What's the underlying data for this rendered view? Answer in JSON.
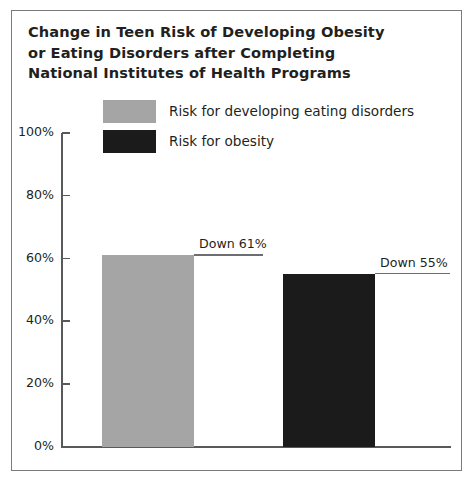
{
  "chart_data": {
    "type": "bar",
    "title": "Change in Teen Risk of Developing Obesity\nor Eating Disorders after Completing\nNational Institutes of Health Programs",
    "xlabel": "",
    "ylabel": "",
    "ylim": [
      0,
      100
    ],
    "ytick_labels": [
      "100%",
      "80%",
      "60%",
      "40%",
      "20%",
      "0%"
    ],
    "ytick_values": [
      100,
      80,
      60,
      40,
      20,
      0
    ],
    "grid": false,
    "legend_position": "top",
    "categories": [
      "Risk for developing eating disorders",
      "Risk for obesity"
    ],
    "values": [
      61,
      55
    ],
    "data_labels": [
      "Down 61%",
      "Down 55%"
    ],
    "series": [
      {
        "name": "Risk for developing eating disorders",
        "value": 61,
        "label": "Down 61%",
        "color": "#a5a5a5"
      },
      {
        "name": "Risk for obesity",
        "value": 55,
        "label": "Down 55%",
        "color": "#1b1b1b"
      }
    ]
  },
  "colors": {
    "eating_disorders": "#a5a5a5",
    "obesity": "#1b1b1b",
    "axis": "#58595b",
    "frame": "#7b7b7b",
    "text": "#231f20"
  }
}
